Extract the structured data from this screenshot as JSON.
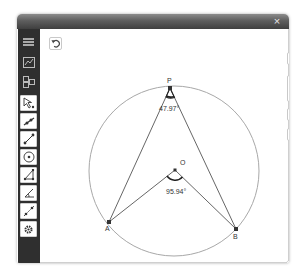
{
  "window": {
    "close_label": "×"
  },
  "sidebar": {
    "top_items": [
      {
        "name": "menu",
        "icon": "hamburger-icon"
      },
      {
        "name": "graphics-view",
        "icon": "graphics-view-icon"
      },
      {
        "name": "perspectives",
        "icon": "perspectives-icon"
      }
    ],
    "tools": [
      {
        "name": "move",
        "icon": "move-arrow-icon"
      },
      {
        "name": "point",
        "icon": "point-on-object-icon"
      },
      {
        "name": "segment",
        "icon": "segment-icon"
      },
      {
        "name": "circle",
        "icon": "circle-center-point-icon"
      },
      {
        "name": "polygon",
        "icon": "polygon-icon"
      },
      {
        "name": "angle",
        "icon": "angle-icon"
      },
      {
        "name": "line-tools",
        "icon": "line-tools-icon"
      },
      {
        "name": "settings",
        "icon": "gear-icon"
      }
    ]
  },
  "canvas": {
    "undo_icon": "undo-icon",
    "controls": {
      "settings_icon": "gear-icon",
      "zoom_in_label": "+",
      "zoom_out_label": "−",
      "standard_view_label": "U",
      "snapshot_icon": "camera-icon",
      "fit_view_icon": "move-view-icon"
    },
    "geometry": {
      "circle": {
        "cx": 134,
        "cy": 142,
        "r": 85
      },
      "points": {
        "P": {
          "label": "P",
          "x": 130,
          "y": 59
        },
        "O": {
          "label": "O",
          "x": 135,
          "y": 141
        },
        "A": {
          "label": "A",
          "x": 69,
          "y": 193
        },
        "B": {
          "label": "B",
          "x": 196,
          "y": 200
        }
      },
      "angles": {
        "APB": {
          "label": "47.97°"
        },
        "AOB": {
          "label": "95.94°"
        }
      },
      "colors": {
        "circle": "#a8a8a8",
        "segment": "#555555",
        "point": "#333333"
      }
    }
  }
}
